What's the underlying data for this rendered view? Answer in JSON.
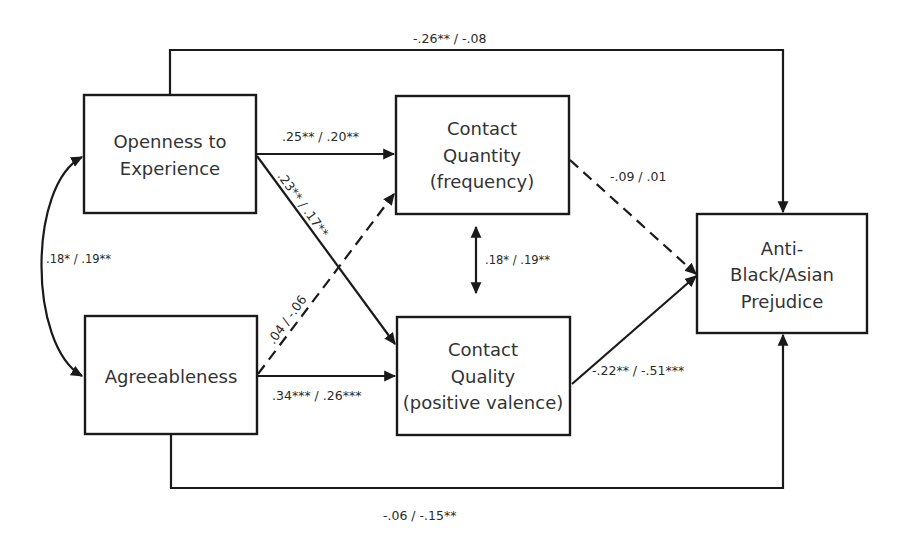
{
  "nodes": {
    "openness": {
      "line1": "Openness to",
      "line2": "Experience"
    },
    "agreeableness": {
      "line1": "Agreeableness"
    },
    "contact_quantity": {
      "line1": "Contact",
      "line2": "Quantity",
      "line3": "(frequency)"
    },
    "contact_quality": {
      "line1": "Contact",
      "line2": "Quality",
      "line3": "(positive valence)"
    },
    "prejudice": {
      "line1": "Anti-",
      "line2": "Black/Asian",
      "line3": "Prejudice"
    }
  },
  "paths": {
    "openness_to_prejudice": {
      "label": "-.26** / -.08",
      "style": "solid"
    },
    "openness_to_quantity": {
      "label": ".25** / .20**",
      "style": "solid"
    },
    "openness_to_quality": {
      "label": ".23** / .17**",
      "style": "solid"
    },
    "agreeableness_to_quantity": {
      "label": ".04 / -.06",
      "style": "dashed"
    },
    "agreeableness_to_quality": {
      "label": ".34*** / .26***",
      "style": "solid"
    },
    "quantity_to_prejudice": {
      "label": "-.09 / .01",
      "style": "dashed"
    },
    "quality_to_prejudice": {
      "label": "-.22** / -.51***",
      "style": "solid"
    },
    "agreeableness_to_prejudice": {
      "label": "-.06 / -.15**",
      "style": "solid"
    },
    "openness_agreeableness_cov": {
      "label": ".18* / .19**",
      "style": "solid-curved-bidirectional"
    },
    "quantity_quality_cov": {
      "label": ".18* / .19**",
      "style": "solid-bidirectional"
    }
  },
  "colors": {
    "stroke": "#1a1a1a",
    "text": "#333333",
    "background": "#ffffff"
  }
}
